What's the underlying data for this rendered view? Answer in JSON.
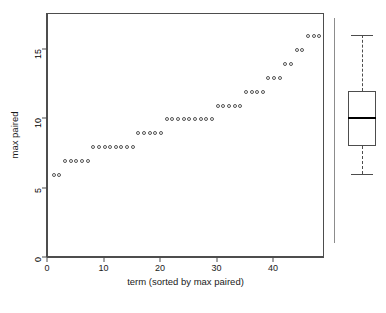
{
  "chart_data": {
    "type": "scatter",
    "title": "",
    "xlabel": "term (sorted by max paired)",
    "ylabel": "max paired",
    "xlim": [
      0,
      49
    ],
    "ylim": [
      0,
      17.6
    ],
    "xticks": [
      0,
      10,
      20,
      30,
      40
    ],
    "yticks": [
      0,
      5,
      10,
      15
    ],
    "grid": false,
    "legend": null,
    "marker": "open-circle",
    "x": [
      1,
      2,
      3,
      4,
      5,
      6,
      7,
      8,
      9,
      10,
      11,
      12,
      13,
      14,
      15,
      16,
      17,
      18,
      19,
      20,
      21,
      22,
      23,
      24,
      25,
      26,
      27,
      28,
      29,
      30,
      31,
      32,
      33,
      34,
      35,
      36,
      37,
      38,
      39,
      40,
      41,
      42,
      43,
      44,
      45,
      46,
      47,
      48
    ],
    "y": [
      6,
      6,
      7,
      7,
      7,
      7,
      7,
      8,
      8,
      8,
      8,
      8,
      8,
      8,
      8,
      9,
      9,
      9,
      9,
      9,
      10,
      10,
      10,
      10,
      10,
      10,
      10,
      10,
      10,
      11,
      11,
      11,
      11,
      11,
      12,
      12,
      12,
      12,
      13,
      13,
      13,
      14,
      14,
      15,
      15,
      16,
      16,
      16
    ],
    "level_counts": [
      {
        "value": 6,
        "count": 2
      },
      {
        "value": 7,
        "count": 5
      },
      {
        "value": 8,
        "count": 8
      },
      {
        "value": 9,
        "count": 5
      },
      {
        "value": 10,
        "count": 9
      },
      {
        "value": 11,
        "count": 5
      },
      {
        "value": 12,
        "count": 4
      },
      {
        "value": 13,
        "count": 3
      },
      {
        "value": 14,
        "count": 2
      },
      {
        "value": 15,
        "count": 2
      },
      {
        "value": 16,
        "count": 3
      }
    ],
    "n_points": 48,
    "boxplot": {
      "min": 6,
      "q1": 8,
      "median": 10,
      "q3": 12,
      "max": 16,
      "orientation": "vertical",
      "whisker_style": "dashed"
    },
    "colors": {
      "point_stroke": "#555555",
      "axis": "#4d4d4d",
      "median": "#000000",
      "background": "#ffffff",
      "divider": "#8c8c8c"
    }
  }
}
